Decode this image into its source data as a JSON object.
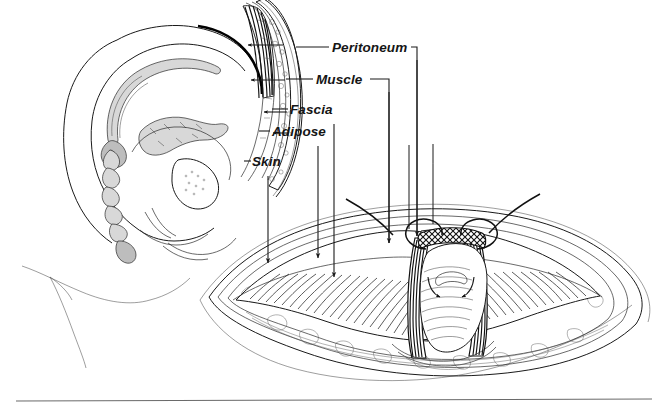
{
  "figure": {
    "background_color": "#ffffff",
    "ink_color": "#1a1a1a",
    "rule_color": "#6a6a6a",
    "labels": [
      {
        "id": "peritoneum",
        "text": "Peritoneum",
        "x": 332,
        "y": 52
      },
      {
        "id": "muscle",
        "text": "Muscle",
        "x": 316,
        "y": 84
      },
      {
        "id": "fascia",
        "text": "Fascia",
        "x": 290,
        "y": 114
      },
      {
        "id": "adipose",
        "text": "Adipose",
        "x": 272,
        "y": 136
      },
      {
        "id": "skin",
        "text": "Skin",
        "x": 252,
        "y": 166
      }
    ],
    "panels": {
      "sagittal": {
        "name": "sagittal-section-pregnant-abdomen",
        "description": "Mid-sagittal line drawing of gravid uterus, fetus, spine, bladder and abdominal wall"
      },
      "surgical": {
        "name": "laparotomy-surgical-field",
        "description": "Transverse abdominal incision retracted open exposing the uterus"
      }
    },
    "arrows": [
      {
        "id": "skin-arrow",
        "from": [
          268,
          176
        ],
        "to": [
          268,
          263
        ]
      },
      {
        "id": "adipose-arrow",
        "from": [
          318,
          146
        ],
        "to": [
          318,
          258
        ]
      },
      {
        "id": "fascia-arrow",
        "from": [
          334,
          124
        ],
        "to": [
          334,
          277
        ]
      },
      {
        "id": "muscle-arrow",
        "from": [
          389,
          92
        ],
        "to": [
          389,
          243
        ]
      },
      {
        "id": "peritoneum-arrow",
        "from": [
          417,
          60
        ],
        "to": [
          417,
          236
        ]
      }
    ],
    "footer_rule": {
      "id": "bottom-rule",
      "y": 400
    }
  }
}
